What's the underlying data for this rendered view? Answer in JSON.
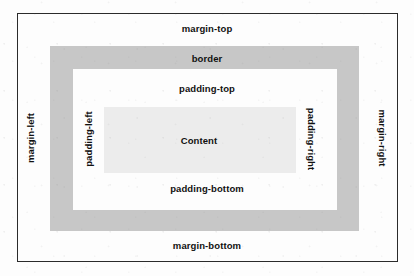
{
  "diagram": {
    "name": "css-box-model",
    "canvas": {
      "width": 414,
      "height": 276,
      "background": "#fdfdfd"
    },
    "boxes": {
      "margin": {
        "label_top": "margin-top",
        "label_bottom": "margin-bottom",
        "label_left": "margin-left",
        "label_right": "margin-right",
        "border_color": "#2b2b2b",
        "fill": "#fdfdfd"
      },
      "border": {
        "label": "border",
        "fill": "#c7c7c7"
      },
      "padding": {
        "label_top": "padding-top",
        "label_bottom": "padding-bottom",
        "label_left": "padding-left",
        "label_right": "padding-right",
        "fill": "#fdfdfd"
      },
      "content": {
        "label": "Content",
        "fill": "#ececec"
      }
    }
  }
}
